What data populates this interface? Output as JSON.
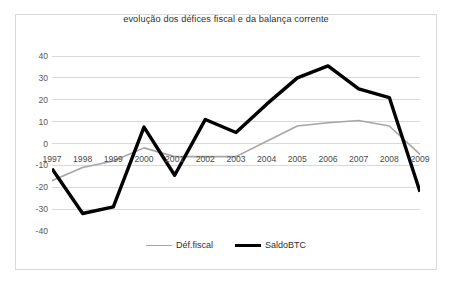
{
  "chart_data": {
    "type": "line",
    "title": "evolução dos défices fiscal e da balança corrente",
    "xlabel": "",
    "ylabel": "",
    "categories": [
      "1997",
      "1998",
      "1999",
      "2000",
      "2001",
      "2002",
      "2003",
      "2004",
      "2005",
      "2006",
      "2007",
      "2008",
      "2009"
    ],
    "series": [
      {
        "name": "Déf.fiscal",
        "color": "#a6a6a6",
        "width": 1.6,
        "values": [
          -17,
          -11,
          -8,
          -2,
          -6,
          -6,
          -6,
          1,
          8,
          9.5,
          10.5,
          8,
          -5
        ]
      },
      {
        "name": "SaldoBTC",
        "color": "#000000",
        "width": 3.4,
        "values": [
          -11.5,
          -32,
          -29,
          7.5,
          -14.5,
          11,
          5,
          18,
          30,
          35.5,
          25,
          21,
          -22
        ]
      }
    ],
    "ylim": [
      -40,
      40
    ],
    "yticks": [
      "40",
      "30",
      "20",
      "10",
      "0",
      "-10",
      "-20",
      "-30",
      "-40"
    ],
    "ytick_values": [
      40,
      30,
      20,
      10,
      0,
      -10,
      -20,
      -30,
      -40
    ],
    "grid": true,
    "grid_color": "#d9d9d9",
    "legend_position": "bottom",
    "plot_background": "#ffffff",
    "border_color": "#d9d9d9"
  },
  "legend": {
    "items": [
      {
        "label": "Déf.fiscal"
      },
      {
        "label": "SaldoBTC"
      }
    ]
  }
}
